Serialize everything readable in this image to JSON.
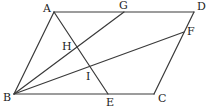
{
  "figure": {
    "type": "geometry",
    "stroke_color": "#3a3a3a",
    "label_color": "#222222",
    "points": {
      "A": {
        "label": "A",
        "x": 54,
        "y": 12,
        "lx": 43,
        "ly": 12
      },
      "D": {
        "label": "D",
        "x": 194,
        "y": 12,
        "lx": 197,
        "ly": 10
      },
      "B": {
        "label": "B",
        "x": 14,
        "y": 94,
        "lx": 3,
        "ly": 101
      },
      "C": {
        "label": "C",
        "x": 154,
        "y": 94,
        "lx": 158,
        "ly": 102
      },
      "G": {
        "label": "G",
        "x": 124,
        "y": 12,
        "lx": 119,
        "ly": 9
      },
      "F": {
        "label": "F",
        "x": 184,
        "y": 32,
        "lx": 187,
        "ly": 35
      },
      "E": {
        "label": "E",
        "x": 108,
        "y": 94,
        "lx": 106,
        "ly": 106
      },
      "H": {
        "label": "H",
        "x": 77,
        "y": 46,
        "lx": 62,
        "ly": 50
      },
      "I": {
        "label": "I",
        "x": 93,
        "y": 67,
        "lx": 86,
        "ly": 80
      }
    },
    "segments": [
      {
        "name": "AD",
        "from": "A",
        "to": "D"
      },
      {
        "name": "DC",
        "from": "D",
        "to": "C"
      },
      {
        "name": "CB",
        "from": "C",
        "to": "B"
      },
      {
        "name": "BA",
        "from": "B",
        "to": "A"
      },
      {
        "name": "BG",
        "from": "B",
        "to": "G"
      },
      {
        "name": "BF",
        "from": "B",
        "to": "F"
      },
      {
        "name": "AE",
        "from": "A",
        "to": "E"
      }
    ]
  }
}
